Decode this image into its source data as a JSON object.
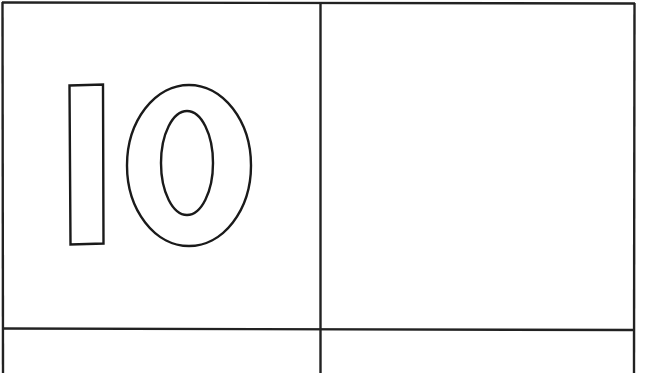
{
  "worksheet": {
    "number_text": "10",
    "digits": [
      "1",
      "0"
    ],
    "style": "outlined-block-numerals",
    "colors": {
      "background": "#ffffff",
      "line": "#222222"
    },
    "grid": {
      "columns": 2,
      "visible_rows": 2,
      "cells": [
        {
          "row": 0,
          "col": 0,
          "content": "10"
        },
        {
          "row": 0,
          "col": 1,
          "content": ""
        },
        {
          "row": 1,
          "col": 0,
          "content": ""
        },
        {
          "row": 1,
          "col": 1,
          "content": ""
        }
      ]
    }
  }
}
